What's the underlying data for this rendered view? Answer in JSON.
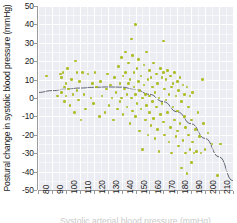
{
  "chart_data": {
    "type": "scatter",
    "title": "",
    "xlabel": "Systolic arterial blood pressure (mmHg)",
    "ylabel": "Postural change in systolic blood pressure (mmHg)",
    "xlim": [
      80,
      220
    ],
    "ylim": [
      -50,
      50
    ],
    "xticks": [
      80,
      90,
      100,
      110,
      120,
      130,
      140,
      150,
      160,
      170,
      180,
      190,
      200,
      210,
      220
    ],
    "yticks": [
      50,
      40,
      30,
      20,
      10,
      0,
      -10,
      -20,
      -30,
      -40,
      -50
    ],
    "grid": true,
    "legend": "none",
    "point_color": "#a8b818",
    "panel_color": "#ecedf2",
    "gridline_color": "#ffffff",
    "fit_line_color": "#4c5461",
    "fit_line": {
      "description": "smoothed quadratic trend curve",
      "x": [
        80,
        90,
        100,
        110,
        120,
        130,
        140,
        150,
        160,
        170,
        180,
        190,
        200,
        210,
        220
      ],
      "y": [
        3.0,
        4.0,
        4.8,
        5.4,
        5.8,
        6.0,
        5.9,
        4.6,
        2.0,
        -2.0,
        -7.5,
        -14.0,
        -22.0,
        -32.0,
        -45.0
      ]
    },
    "points": [
      [
        86,
        12
      ],
      [
        94,
        1
      ],
      [
        96,
        13
      ],
      [
        97,
        11
      ],
      [
        97,
        3
      ],
      [
        98,
        14
      ],
      [
        99,
        6
      ],
      [
        99,
        -2
      ],
      [
        100,
        8
      ],
      [
        100,
        1
      ],
      [
        101,
        16
      ],
      [
        102,
        5
      ],
      [
        103,
        -4
      ],
      [
        104,
        10
      ],
      [
        105,
        2
      ],
      [
        106,
        -8
      ],
      [
        107,
        20
      ],
      [
        108,
        4
      ],
      [
        108,
        14
      ],
      [
        109,
        -1
      ],
      [
        110,
        9
      ],
      [
        111,
        -12
      ],
      [
        112,
        14
      ],
      [
        113,
        2
      ],
      [
        114,
        -6
      ],
      [
        116,
        13
      ],
      [
        118,
        0
      ],
      [
        119,
        8
      ],
      [
        120,
        -3
      ],
      [
        121,
        14
      ],
      [
        122,
        6
      ],
      [
        124,
        -10
      ],
      [
        125,
        9
      ],
      [
        126,
        1
      ],
      [
        128,
        -8
      ],
      [
        129,
        5
      ],
      [
        130,
        13
      ],
      [
        131,
        -4
      ],
      [
        132,
        7
      ],
      [
        133,
        0
      ],
      [
        134,
        -12
      ],
      [
        135,
        11
      ],
      [
        136,
        3
      ],
      [
        137,
        -6
      ],
      [
        138,
        17
      ],
      [
        139,
        8
      ],
      [
        139,
        -2
      ],
      [
        140,
        22
      ],
      [
        140,
        0
      ],
      [
        141,
        12
      ],
      [
        141,
        -9
      ],
      [
        142,
        5
      ],
      [
        143,
        25
      ],
      [
        143,
        14
      ],
      [
        144,
        -5
      ],
      [
        144,
        2
      ],
      [
        145,
        19
      ],
      [
        145,
        8
      ],
      [
        146,
        -14
      ],
      [
        146,
        10
      ],
      [
        147,
        32
      ],
      [
        147,
        0
      ],
      [
        148,
        23
      ],
      [
        148,
        -7
      ],
      [
        149,
        14
      ],
      [
        149,
        6
      ],
      [
        150,
        40
      ],
      [
        150,
        2
      ],
      [
        150,
        -10
      ],
      [
        151,
        16
      ],
      [
        151,
        -3
      ],
      [
        152,
        21
      ],
      [
        152,
        9
      ],
      [
        153,
        -18
      ],
      [
        153,
        4
      ],
      [
        154,
        12
      ],
      [
        154,
        -6
      ],
      [
        155,
        0
      ],
      [
        155,
        -28
      ],
      [
        156,
        18
      ],
      [
        156,
        7
      ],
      [
        157,
        -12
      ],
      [
        157,
        2
      ],
      [
        158,
        25
      ],
      [
        158,
        -4
      ],
      [
        159,
        10
      ],
      [
        159,
        -20
      ],
      [
        160,
        15
      ],
      [
        160,
        1
      ],
      [
        160,
        -8
      ],
      [
        161,
        11
      ],
      [
        161,
        -15
      ],
      [
        162,
        6
      ],
      [
        162,
        -2
      ],
      [
        163,
        19
      ],
      [
        163,
        -11
      ],
      [
        164,
        3
      ],
      [
        164,
        -22
      ],
      [
        165,
        13
      ],
      [
        165,
        -5
      ],
      [
        166,
        8
      ],
      [
        166,
        -17
      ],
      [
        167,
        0
      ],
      [
        167,
        -29
      ],
      [
        168,
        16
      ],
      [
        168,
        -9
      ],
      [
        169,
        11
      ],
      [
        169,
        -3
      ],
      [
        170,
        31
      ],
      [
        170,
        14
      ],
      [
        170,
        -13
      ],
      [
        171,
        5
      ],
      [
        171,
        -20
      ],
      [
        172,
        10
      ],
      [
        172,
        -1
      ],
      [
        173,
        15
      ],
      [
        173,
        -8
      ],
      [
        174,
        2
      ],
      [
        174,
        -24
      ],
      [
        175,
        12
      ],
      [
        175,
        -16
      ],
      [
        176,
        6
      ],
      [
        176,
        -30
      ],
      [
        177,
        8
      ],
      [
        177,
        -5
      ],
      [
        178,
        14
      ],
      [
        178,
        -12
      ],
      [
        179,
        1
      ],
      [
        179,
        -21
      ],
      [
        180,
        9
      ],
      [
        180,
        -7
      ],
      [
        180,
        -18
      ],
      [
        181,
        4
      ],
      [
        181,
        -26
      ],
      [
        182,
        11
      ],
      [
        182,
        -14
      ],
      [
        183,
        -2
      ],
      [
        183,
        -38
      ],
      [
        184,
        7
      ],
      [
        184,
        -23
      ],
      [
        185,
        2
      ],
      [
        185,
        -10
      ],
      [
        186,
        -30
      ],
      [
        186,
        -16
      ],
      [
        187,
        6
      ],
      [
        187,
        -41
      ],
      [
        188,
        -5
      ],
      [
        188,
        -20
      ],
      [
        189,
        1
      ],
      [
        189,
        -28
      ],
      [
        190,
        -35
      ],
      [
        190,
        -12
      ],
      [
        191,
        -24
      ],
      [
        191,
        3
      ],
      [
        192,
        -30
      ],
      [
        193,
        -17
      ],
      [
        194,
        -29
      ],
      [
        195,
        -8
      ],
      [
        196,
        -21
      ],
      [
        197,
        -30
      ],
      [
        198,
        10
      ],
      [
        199,
        -14
      ],
      [
        200,
        -28
      ],
      [
        202,
        -19
      ],
      [
        205,
        -25
      ],
      [
        209,
        -42
      ],
      [
        211,
        -25
      ]
    ]
  }
}
